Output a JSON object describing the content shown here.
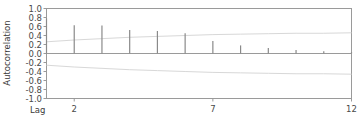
{
  "chart_data": {
    "type": "bar",
    "title": "",
    "subtitle": "",
    "xlabel": "Lag",
    "ylabel": "Autocorrelation",
    "categories": [
      1,
      2,
      3,
      4,
      5,
      6,
      7,
      8,
      9,
      10,
      11,
      12
    ],
    "values": [
      0.78,
      0.63,
      0.62,
      0.52,
      0.5,
      0.45,
      0.28,
      0.18,
      0.12,
      0.08,
      0.05,
      0.03
    ],
    "series": [
      {
        "name": "Autocorrelation",
        "values": [
          0.78,
          0.63,
          0.62,
          0.52,
          0.5,
          0.45,
          0.28,
          0.18,
          0.12,
          0.08,
          0.05,
          0.03
        ]
      },
      {
        "name": "Upper confidence limit",
        "values": [
          0.26,
          0.3,
          0.33,
          0.36,
          0.38,
          0.4,
          0.42,
          0.43,
          0.44,
          0.45,
          0.45,
          0.46
        ]
      },
      {
        "name": "Lower confidence limit",
        "values": [
          -0.26,
          -0.3,
          -0.33,
          -0.36,
          -0.38,
          -0.4,
          -0.42,
          -0.43,
          -0.44,
          -0.45,
          -0.45,
          -0.46
        ]
      }
    ],
    "ylim": [
      -1.0,
      1.0
    ],
    "xlim": [
      1,
      12
    ],
    "ytick_labels": [
      "1.0",
      "0.8",
      "0.6",
      "0.4",
      "0.2",
      "0.0",
      "-0.2",
      "-0.4",
      "-0.6",
      "-0.8",
      "-1.0"
    ],
    "ytick_values": [
      1.0,
      0.8,
      0.6,
      0.4,
      0.2,
      0.0,
      -0.2,
      -0.4,
      -0.6,
      -0.8,
      -1.0
    ],
    "xtick_labels": [
      "2",
      "7",
      "12"
    ],
    "xtick_values": [
      2,
      7,
      12
    ],
    "grid": false,
    "legend": "none",
    "colors": {
      "bar": "#8a8a8a",
      "axis": "#9a9a9a",
      "zero_line": "#9a9a9a",
      "confidence_band": "#d8d8d8",
      "text": "#3a3a3a",
      "background": "#ffffff"
    }
  }
}
